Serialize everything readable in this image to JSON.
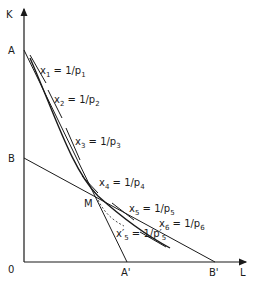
{
  "axes": {
    "y_label": "K",
    "x_label": "L",
    "origin_label": "0"
  },
  "points": {
    "A": "A",
    "B": "B",
    "A_prime": "A'",
    "B_prime": "B'",
    "M": "M"
  },
  "tangent_labels": [
    {
      "var": "x",
      "sub": "1",
      "eq": " = 1/p",
      "psub": "1"
    },
    {
      "var": "x",
      "sub": "2",
      "eq": " = 1/p",
      "psub": "2"
    },
    {
      "var": "x",
      "sub": "3",
      "eq": " = 1/p",
      "psub": "3"
    },
    {
      "var": "x",
      "sub": "4",
      "eq": " = 1/p",
      "psub": "4"
    },
    {
      "var": "x",
      "sub": "5",
      "eq": " = 1/p",
      "psub": "5"
    },
    {
      "var": "x",
      "sub": "6",
      "eq": " = 1/p",
      "psub": "6"
    },
    {
      "var": "x′",
      "sub": "5",
      "eq": " = 1/p′",
      "psub": "5"
    }
  ],
  "colors": {
    "ink": "#1a1a1a",
    "background": "#ffffff"
  }
}
